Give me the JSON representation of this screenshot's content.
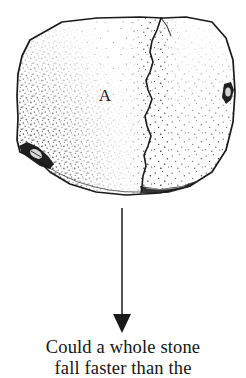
{
  "figure": {
    "label": "A",
    "label_name": "fragment-label-a",
    "object": "stone",
    "ink_color": "#1a1a1a",
    "fill_color": "#ffffff",
    "background_color": "#ffffff",
    "stipple_color": "#2b2b2b"
  },
  "arrow": {
    "name": "downward-arrow",
    "direction": "down",
    "color": "#1a1a1a"
  },
  "caption": {
    "lines": [
      "Could a whole stone",
      "fall faster than the"
    ]
  }
}
